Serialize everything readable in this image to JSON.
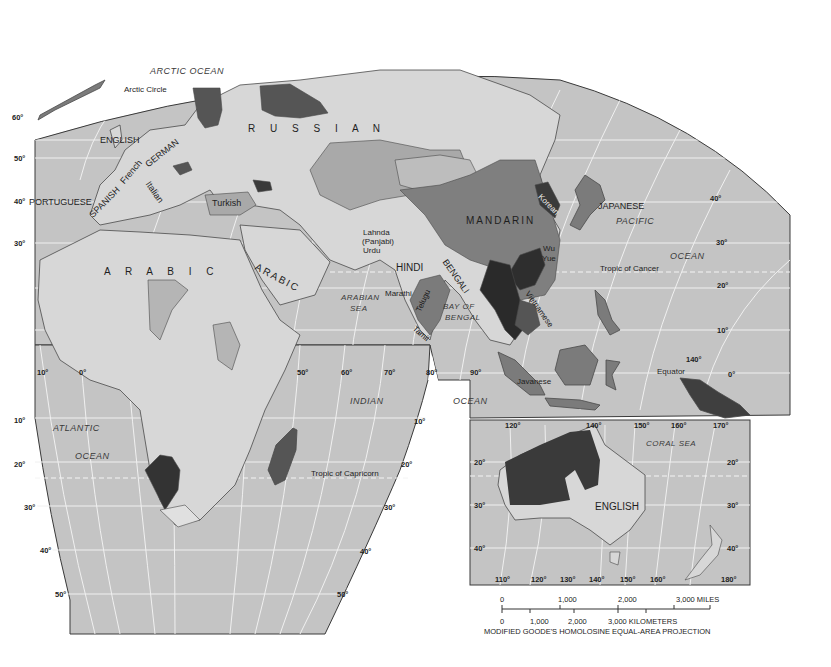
{
  "map": {
    "projection_note": "MODIFIED GOODE'S HOMOLOSINE EQUAL-AREA PROJECTION",
    "colors": {
      "ocean": "#c4c4c4",
      "land": "#d7d7d7",
      "land_light": "#e2e2e2",
      "lang_medium": "#a9a9a9",
      "lang_dark": "#7b7b7b",
      "lang_darkest": "#3a3a3a",
      "grid": "#f2f2f2",
      "border": "#4a4a4a"
    },
    "oceans": [
      {
        "id": "arctic",
        "label": "ARCTIC OCEAN"
      },
      {
        "id": "atlantic1",
        "label": "ATLANTIC"
      },
      {
        "id": "atlantic2",
        "label": "OCEAN"
      },
      {
        "id": "indian1",
        "label": "INDIAN"
      },
      {
        "id": "indian2",
        "label": "OCEAN"
      },
      {
        "id": "pacific1",
        "label": "PACIFIC"
      },
      {
        "id": "pacific2",
        "label": "OCEAN"
      },
      {
        "id": "arabian",
        "label": "ARABIAN"
      },
      {
        "id": "arabian2",
        "label": "SEA"
      },
      {
        "id": "bengal1",
        "label": "BAY OF"
      },
      {
        "id": "bengal2",
        "label": "BENGAL"
      },
      {
        "id": "coral",
        "label": "CORAL SEA"
      }
    ],
    "lines": {
      "arctic_circle": "Arctic Circle",
      "tropic_cancer": "Tropic of Cancer",
      "tropic_capricorn": "Tropic of Capricorn",
      "equator": "Equator"
    },
    "languages": {
      "russian": "R U S S I A N",
      "arabic": "A R A B I C",
      "arabic2": "ARABIC",
      "mandarin": "MANDARIN",
      "english_uk": "ENGLISH",
      "english_au": "ENGLISH",
      "german": "GERMAN",
      "french": "French",
      "italian": "Italian",
      "spanish": "SPANISH",
      "portuguese": "PORTUGUESE",
      "turkish": "Turkish",
      "lahnda1": "Lahnda",
      "lahnda2": "(Panjabi)",
      "urdu": "Urdu",
      "hindi": "HINDI",
      "bengali": "BENGALI",
      "marathi": "Marathi",
      "telugu": "Telugu",
      "tamil": "Tamil",
      "korean": "Korean",
      "japanese": "JAPANESE",
      "wu": "Wu",
      "yue": "Yue",
      "vietnamese": "Vietnamese",
      "javanese": "Javanese"
    },
    "degree_labels": {
      "lat60": "60°",
      "lat50": "50°",
      "lat40w": "40°",
      "lat30w": "30°",
      "lon10w": "10°",
      "lon0": "0°",
      "s10w": "10°",
      "s20w": "20°",
      "s30w": "30°",
      "s40w": "40°",
      "s50w": "50°",
      "lon50": "50°",
      "lon60": "60°",
      "lon70": "70°",
      "lon80": "80°",
      "lon90": "90°",
      "s10e": "10°",
      "s20e": "20°",
      "s30e": "30°",
      "s40e": "40°",
      "s50e": "50°",
      "e40": "40°",
      "e30": "30°",
      "e20": "20°",
      "e10": "10°",
      "e0": "0°",
      "e140": "140°"
    },
    "inset": {
      "top_lons": [
        "120°",
        "140°",
        "150°",
        "160°",
        "170°"
      ],
      "bottom_lons": [
        "110°",
        "120°",
        "130°",
        "140°",
        "150°",
        "160°",
        "180°"
      ],
      "left_lats": [
        "20°",
        "30°",
        "40°"
      ],
      "right_lats": [
        "20°",
        "30°",
        "40°"
      ]
    },
    "scale": {
      "miles": [
        "0",
        "1,000",
        "2,000",
        "3,000 MILES"
      ],
      "km": [
        "0",
        "1,000",
        "2,000",
        "3,000 KILOMETERS"
      ]
    }
  }
}
